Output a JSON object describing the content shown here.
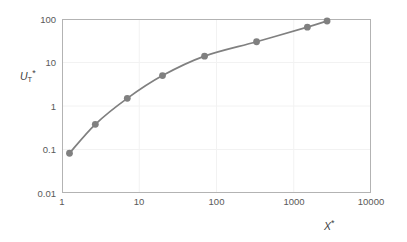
{
  "chart_data": {
    "type": "line",
    "title": "",
    "subtitle": "",
    "xlabel": "X*",
    "ylabel": "UT*",
    "xlabel_base": "X",
    "xlabel_sup": "*",
    "ylabel_base": "U",
    "ylabel_sub": "T",
    "ylabel_sup": "*",
    "xscale": "log",
    "yscale": "log",
    "xlim": [
      1,
      10000
    ],
    "ylim": [
      0.01,
      100
    ],
    "grid": true,
    "legend": null,
    "x_ticks": [
      "1",
      "10",
      "100",
      "1000",
      "10000"
    ],
    "x_tick_values": [
      1,
      10,
      100,
      1000,
      10000
    ],
    "y_ticks": [
      "100",
      "10",
      "1",
      "0.1",
      "0.01"
    ],
    "y_tick_values": [
      100,
      10,
      1,
      0.1,
      0.01
    ],
    "series": [
      {
        "name": "UT*",
        "marker": "circle",
        "color": "#808080",
        "x": [
          1.25,
          2.7,
          7.0,
          20.0,
          70.0,
          330.0,
          1500.0,
          2700.0
        ],
        "values": [
          0.082,
          0.38,
          1.5,
          5.0,
          14.0,
          30.0,
          65.0,
          90.0
        ]
      }
    ]
  },
  "style": {
    "line_color": "#808080",
    "marker_color": "#808080",
    "axis_color": "#a6a6a6",
    "grid_color": "#f0f0f0",
    "text_color": "#595959",
    "background": "#ffffff"
  }
}
